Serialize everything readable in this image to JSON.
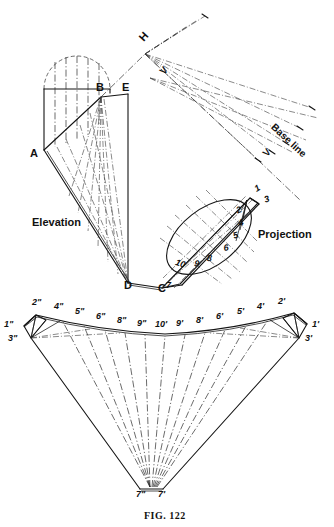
{
  "figure": {
    "caption": "FIG. 122",
    "title_internal": "Development of oblique cone / transition piece",
    "background": "#ffffff",
    "ink": "#141414"
  },
  "views": {
    "elevation": {
      "label": "Elevation"
    },
    "projection": {
      "label": "Projection"
    },
    "baseline": {
      "label": "Base line"
    }
  },
  "elevation_points": [
    {
      "id": "A",
      "label": "A",
      "x": 32,
      "y": 155
    },
    {
      "id": "B",
      "label": "B",
      "x": 101,
      "y": 91
    },
    {
      "id": "E",
      "label": "E",
      "x": 127,
      "y": 91
    },
    {
      "id": "D",
      "label": "D",
      "x": 127,
      "y": 285
    },
    {
      "id": "C",
      "label": "C",
      "x": 163,
      "y": 291
    },
    {
      "id": "H",
      "label": "H",
      "x": 134,
      "y": 44
    },
    {
      "id": "V1",
      "label": "V",
      "x": 153,
      "y": 74
    },
    {
      "id": "V2",
      "label": "V",
      "x": 258,
      "y": 155
    }
  ],
  "projection_points": [
    {
      "label": "1",
      "x": 254,
      "y": 192
    },
    {
      "label": "3",
      "x": 262,
      "y": 200
    },
    {
      "label": "2",
      "x": 239,
      "y": 213
    },
    {
      "label": "4",
      "x": 240,
      "y": 226
    },
    {
      "label": "5",
      "x": 236,
      "y": 237
    },
    {
      "label": "6",
      "x": 228,
      "y": 249
    },
    {
      "label": "8",
      "x": 212,
      "y": 260
    },
    {
      "label": "9",
      "x": 200,
      "y": 265
    },
    {
      "label": "10",
      "x": 184,
      "y": 264
    },
    {
      "label": "7",
      "x": 170,
      "y": 287
    }
  ],
  "development": {
    "apex_labels": [
      {
        "label": "7\"",
        "x": 140,
        "y": 496
      },
      {
        "label": "7'",
        "x": 161,
        "y": 496
      }
    ],
    "left_corner_labels": [
      {
        "label": "1\"",
        "x": 7,
        "y": 327
      },
      {
        "label": "3\"",
        "x": 11,
        "y": 341
      }
    ],
    "right_corner_labels": [
      {
        "label": "1'",
        "x": 313,
        "y": 327
      },
      {
        "label": "3'",
        "x": 307,
        "y": 341
      }
    ],
    "arc_labels_left": [
      {
        "label": "2\"",
        "x": 36,
        "y": 305
      },
      {
        "label": "4\"",
        "x": 58,
        "y": 308
      },
      {
        "label": "5\"",
        "x": 79,
        "y": 313
      },
      {
        "label": "6\"",
        "x": 100,
        "y": 318
      },
      {
        "label": "8\"",
        "x": 120,
        "y": 322
      },
      {
        "label": "9\"",
        "x": 140,
        "y": 325
      }
    ],
    "arc_labels_center": [
      {
        "label": "10'",
        "x": 158,
        "y": 326
      }
    ],
    "arc_labels_right": [
      {
        "label": "9'",
        "x": 178,
        "y": 325
      },
      {
        "label": "8'",
        "x": 198,
        "y": 322
      },
      {
        "label": "6'",
        "x": 218,
        "y": 318
      },
      {
        "label": "5'",
        "x": 239,
        "y": 313
      },
      {
        "label": "4'",
        "x": 259,
        "y": 308
      },
      {
        "label": "2'",
        "x": 280,
        "y": 304
      }
    ]
  }
}
